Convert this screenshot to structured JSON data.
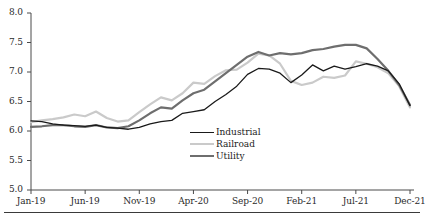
{
  "chart_data": {
    "type": "line",
    "title": "",
    "subtitle": "",
    "xlabel": "",
    "ylabel": "",
    "ylim": [
      5.0,
      8.0
    ],
    "yticks": [
      5.0,
      5.5,
      6.0,
      6.5,
      7.0,
      7.5,
      8.0
    ],
    "ytick_labels": [
      "5.0",
      "5.5",
      "6.0",
      "6.5",
      "7.0",
      "7.5",
      "8.0"
    ],
    "grid": false,
    "legend_position": "center",
    "x": [
      "Jan-19",
      "Feb-19",
      "Mar-19",
      "Apr-19",
      "May-19",
      "Jun-19",
      "Jul-19",
      "Aug-19",
      "Sep-19",
      "Oct-19",
      "Nov-19",
      "Dec-19",
      "Jan-20",
      "Feb-20",
      "Mar-20",
      "Apr-20",
      "May-20",
      "Jun-20",
      "Jul-20",
      "Aug-20",
      "Sep-20",
      "Oct-20",
      "Nov-20",
      "Dec-20",
      "Jan-21",
      "Feb-21",
      "Mar-21",
      "Apr-21",
      "May-21",
      "Jun-21",
      "Jul-21",
      "Aug-21",
      "Sep-21",
      "Oct-21",
      "Nov-21",
      "Dec-21"
    ],
    "xtick_labels": [
      "Jan-19",
      "Jun-19",
      "Nov-19",
      "Apr-20",
      "Sep-20",
      "Feb-21",
      "Jul-21",
      "Dec-21"
    ],
    "xtick_indices": [
      0,
      5,
      10,
      15,
      20,
      25,
      30,
      35
    ],
    "series": [
      {
        "name": "Industrial",
        "color": "#1a1a1a",
        "width": 1.3,
        "values": [
          6.17,
          6.16,
          6.12,
          6.1,
          6.09,
          6.08,
          6.1,
          6.06,
          6.05,
          6.03,
          6.06,
          6.12,
          6.16,
          6.18,
          6.3,
          6.33,
          6.36,
          6.5,
          6.62,
          6.76,
          6.96,
          7.06,
          7.05,
          6.98,
          6.82,
          6.95,
          7.12,
          7.02,
          7.1,
          7.05,
          7.09,
          7.14,
          7.1,
          7.02,
          6.8,
          6.43
        ]
      },
      {
        "name": "Railroad",
        "color": "#cacaca",
        "width": 2.2,
        "values": [
          6.15,
          6.18,
          6.2,
          6.23,
          6.28,
          6.25,
          6.33,
          6.22,
          6.16,
          6.18,
          6.32,
          6.45,
          6.57,
          6.52,
          6.64,
          6.82,
          6.8,
          6.93,
          7.03,
          7.04,
          7.16,
          7.31,
          7.28,
          7.14,
          6.85,
          6.78,
          6.82,
          6.92,
          6.9,
          6.94,
          7.18,
          7.14,
          7.08,
          6.98,
          6.76,
          6.4
        ]
      },
      {
        "name": "Utility",
        "color": "#6e6e6e",
        "width": 2.2,
        "values": [
          6.07,
          6.08,
          6.1,
          6.1,
          6.08,
          6.07,
          6.1,
          6.06,
          6.05,
          6.08,
          6.18,
          6.3,
          6.4,
          6.38,
          6.52,
          6.64,
          6.7,
          6.84,
          6.98,
          7.12,
          7.26,
          7.34,
          7.28,
          7.32,
          7.3,
          7.32,
          7.37,
          7.39,
          7.43,
          7.46,
          7.46,
          7.4,
          7.22,
          7.02,
          6.78,
          6.44
        ]
      }
    ]
  },
  "legend": {
    "items": [
      {
        "label": "Industrial",
        "color": "#1a1a1a"
      },
      {
        "label": "Railroad",
        "color": "#cacaca"
      },
      {
        "label": "Utility",
        "color": "#6e6e6e"
      }
    ]
  }
}
